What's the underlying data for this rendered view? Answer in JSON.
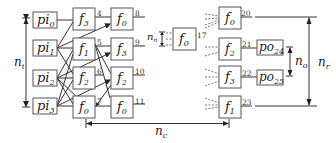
{
  "diagram": {
    "inputs": [
      {
        "name": "pi",
        "sub": "0"
      },
      {
        "name": "pi",
        "sub": "1"
      },
      {
        "name": "pi",
        "sub": "2"
      },
      {
        "name": "pi",
        "sub": "3"
      }
    ],
    "column1": [
      {
        "fn": "f",
        "sub": "3",
        "id": "4"
      },
      {
        "fn": "f",
        "sub": "1",
        "id": "5"
      },
      {
        "fn": "f",
        "sub": "2",
        "id": "6"
      },
      {
        "fn": "f",
        "sub": "0",
        "id": "7"
      }
    ],
    "column2": [
      {
        "fn": "f",
        "sub": "0",
        "id": "8"
      },
      {
        "fn": "f",
        "sub": "3",
        "id": "9"
      },
      {
        "fn": "f",
        "sub": "2",
        "id": "10"
      },
      {
        "fn": "f",
        "sub": "0",
        "id": "11"
      }
    ],
    "middle_node": {
      "fn": "f",
      "sub": "0",
      "id": "17"
    },
    "last_column": [
      {
        "fn": "f",
        "sub": "0",
        "id": "20"
      },
      {
        "fn": "f",
        "sub": "2",
        "id": "21"
      },
      {
        "fn": "f",
        "sub": "3",
        "id": "22"
      },
      {
        "fn": "f",
        "sub": "1",
        "id": "23"
      }
    ],
    "outputs": [
      {
        "name": "po",
        "sub": "24"
      },
      {
        "name": "po",
        "sub": "25"
      }
    ],
    "dimensions": {
      "ni": {
        "name": "n",
        "sub": "i"
      },
      "nn": {
        "name": "n",
        "sub": "n"
      },
      "nc": {
        "name": "n",
        "sub": "c"
      },
      "no": {
        "name": "n",
        "sub": "o"
      },
      "nr": {
        "name": "n",
        "sub": "r"
      }
    }
  }
}
